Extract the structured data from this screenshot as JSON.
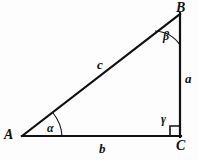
{
  "figure": {
    "type": "right-triangle-geometry-diagram",
    "background_color": "#fdfdfd",
    "stroke_color": "#111111",
    "vertices": {
      "A": {
        "label": "A",
        "x": 22,
        "y": 136
      },
      "B": {
        "label": "B",
        "x": 180,
        "y": 14
      },
      "C": {
        "label": "C",
        "x": 180,
        "y": 136
      }
    },
    "sides": {
      "a": {
        "label": "a",
        "from": "B",
        "to": "C",
        "description": "vertical leg"
      },
      "b": {
        "label": "b",
        "from": "A",
        "to": "C",
        "description": "horizontal base leg"
      },
      "c": {
        "label": "c",
        "from": "A",
        "to": "B",
        "description": "hypotenuse"
      }
    },
    "angles": {
      "alpha": {
        "label": "α",
        "at_vertex": "A"
      },
      "beta": {
        "label": "β",
        "at_vertex": "B"
      },
      "gamma": {
        "label": "γ",
        "at_vertex": "C",
        "right_angle": true
      }
    }
  }
}
